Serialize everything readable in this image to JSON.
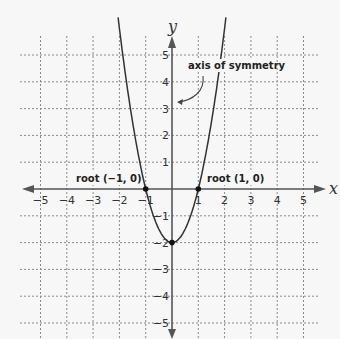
{
  "chart_data": {
    "type": "line",
    "title": "",
    "xlabel": "x",
    "ylabel": "y",
    "xlim": [
      -5,
      5
    ],
    "ylim": [
      -5,
      5
    ],
    "grid": true,
    "x_ticks": [
      -5,
      -4,
      -3,
      -2,
      -1,
      1,
      2,
      3,
      4,
      5
    ],
    "y_ticks": [
      5,
      4,
      3,
      2,
      1,
      -1,
      -2,
      -3,
      -4,
      -5
    ],
    "x_tick_labels": [
      "−5",
      "−4",
      "−3",
      "−2",
      "−1",
      "1",
      "2",
      "3",
      "4",
      "5"
    ],
    "y_tick_labels": [
      "5",
      "4",
      "3",
      "2",
      "1",
      "−1",
      "−2",
      "−3",
      "−4",
      "−5"
    ],
    "series": [
      {
        "name": "y = 2x² − 2",
        "function": "2x^2 - 2",
        "x": [
          -2.05,
          -1.5,
          -1,
          -0.5,
          0,
          0.5,
          1,
          1.5,
          2.05
        ],
        "y": [
          6.4,
          2.5,
          0,
          -1.5,
          -2,
          -1.5,
          0,
          2.5,
          6.4
        ]
      }
    ],
    "points": [
      {
        "x": -1,
        "y": 0,
        "label": "root (−1, 0)"
      },
      {
        "x": 1,
        "y": 0,
        "label": "root (1, 0)"
      },
      {
        "x": 0,
        "y": -2,
        "label": ""
      }
    ],
    "annotations": [
      {
        "text": "axis of symmetry",
        "points_to": "y-axis (x = 0)"
      }
    ]
  },
  "labels": {
    "x_axis": "x",
    "y_axis": "y",
    "root_left": "root (−1, 0)",
    "root_right": "root (1, 0)",
    "axis_of_symmetry": "axis of symmetry"
  }
}
